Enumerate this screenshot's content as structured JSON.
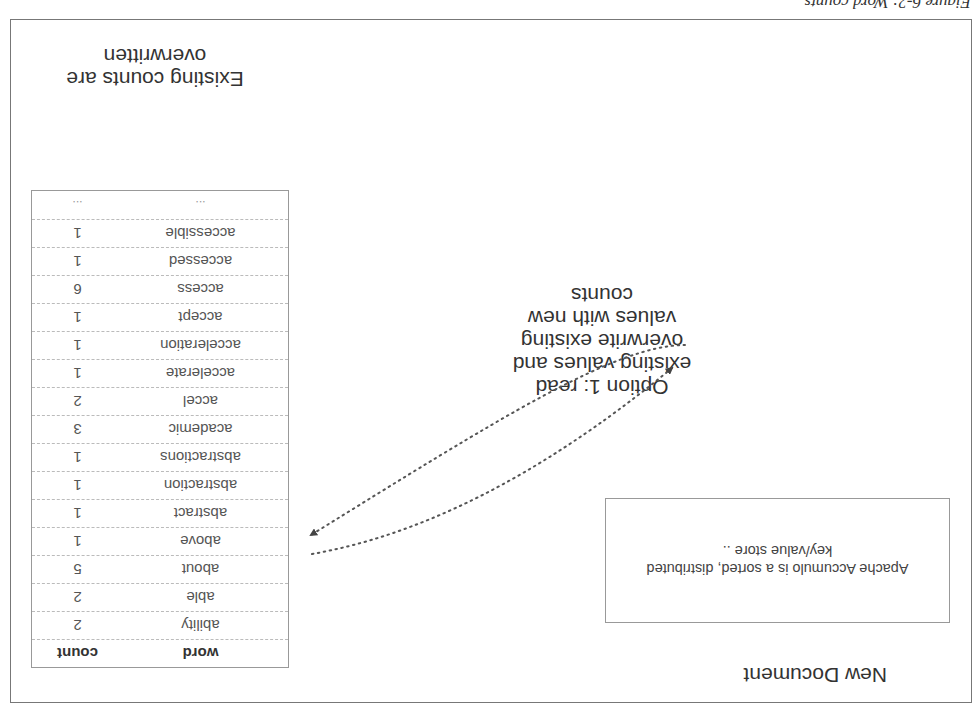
{
  "orientation": "rotated-180",
  "caption": {
    "text": "Figure 6-2: Word counts ..."
  },
  "new_document": {
    "title": "New Document",
    "content": "Apache Accumulo is a sorted, distributed key/value store .."
  },
  "option": {
    "label": "Option 1: read existing values and overwrite existing values with new counts"
  },
  "table": {
    "headers": {
      "word": "word",
      "count": "count"
    },
    "rows": [
      {
        "word": "ability",
        "count": "2"
      },
      {
        "word": "able",
        "count": "2"
      },
      {
        "word": "about",
        "count": "5"
      },
      {
        "word": "above",
        "count": "1"
      },
      {
        "word": "abstract",
        "count": "1"
      },
      {
        "word": "abstraction",
        "count": "1"
      },
      {
        "word": "abstractions",
        "count": "1"
      },
      {
        "word": "academic",
        "count": "3"
      },
      {
        "word": "accel",
        "count": "2"
      },
      {
        "word": "accelerate",
        "count": "1"
      },
      {
        "word": "acceleration",
        "count": "1"
      },
      {
        "word": "accept",
        "count": "1"
      },
      {
        "word": "access",
        "count": "6"
      },
      {
        "word": "accessed",
        "count": "1"
      },
      {
        "word": "accessible",
        "count": "1"
      },
      {
        "word": "...",
        "count": "..."
      }
    ]
  },
  "annotation": {
    "text": "Existing counts are overwritten"
  },
  "colors": {
    "border": "#999999",
    "text": "#333333",
    "arrow": "#555555"
  }
}
